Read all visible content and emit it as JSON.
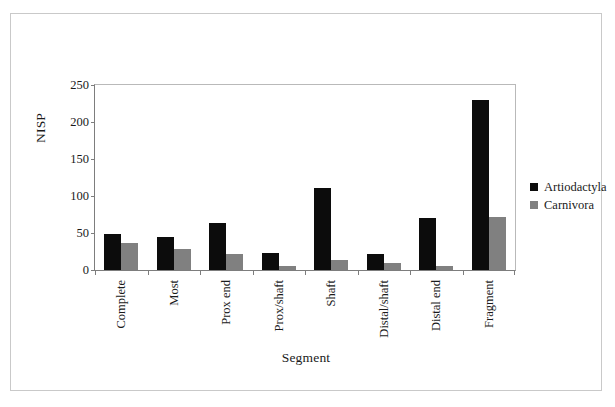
{
  "chart_data": {
    "type": "bar",
    "title": "",
    "xlabel": "Segment",
    "ylabel": "NISP",
    "ylim": [
      0,
      250
    ],
    "yticks": [
      0,
      50,
      100,
      150,
      200,
      250
    ],
    "grid": false,
    "legend_position": "right",
    "categories": [
      "Complete",
      "Most",
      "Prox end",
      "Prox/shaft",
      "Shaft",
      "Distal/shaft",
      "Distal end",
      "Fragment"
    ],
    "series": [
      {
        "name": "Artiodactyla",
        "color": "#0c0c0c",
        "values": [
          48,
          44,
          64,
          23,
          111,
          21,
          70,
          230
        ]
      },
      {
        "name": "Carnivora",
        "color": "#808080",
        "values": [
          37,
          29,
          21,
          6,
          14,
          10,
          6,
          71
        ]
      }
    ]
  }
}
